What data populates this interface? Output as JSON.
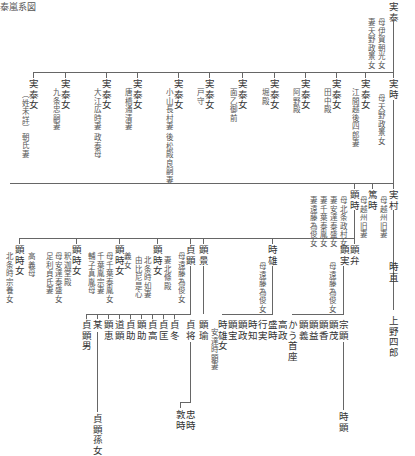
{
  "title": "泰嵐系図",
  "root": {
    "name": "実泰",
    "notes": [
      "母伊賀朝光女",
      "妻天野政景女"
    ]
  },
  "gen1": {
    "daughters": [
      {
        "name": "実泰女",
        "note": "江間越後四郎妻"
      },
      {
        "name": "実泰女",
        "note": "田中殿"
      },
      {
        "name": "実泰女",
        "note": "阿野殿"
      },
      {
        "name": "実泰女",
        "note": "堀殿"
      },
      {
        "name": "実泰女",
        "note": "面乙御前"
      },
      {
        "name": "実泰女",
        "note": "戸守"
      },
      {
        "name": "実泰女",
        "note": "小山長村妻 後松殿良嗣妻"
      },
      {
        "name": "実泰女",
        "note": "唐橋通清妻"
      },
      {
        "name": "実泰女",
        "note": "大江広時妻 政泰母"
      },
      {
        "name": "実泰女",
        "note": "九条忠嗣妻"
      },
      {
        "name": "実泰女",
        "note": "（姓未詳）朝氏妻"
      }
    ],
    "son": {
      "name": "実時",
      "note": "母天野政景女"
    }
  },
  "gen2": {
    "sanemura": {
      "name": "実村",
      "note": "母越州旧妻"
    },
    "atsutoki": {
      "name": "篤時",
      "note": "母越州旧妻"
    },
    "akitoki": {
      "name": "顕時",
      "notes": [
        "母北条政村女",
        "妻安達泰盛女",
        "妻千葉泰胤女",
        "妻遠藤為俊女"
      ]
    }
  },
  "gen3": {
    "daughters": [
      {
        "name": "顕時女",
        "notes": [
          "北条時宗養女"
        ],
        "extra": "高義母"
      },
      {
        "name": "顕時女",
        "notes": [
          "足利貞氏妻",
          "母安達泰盛女",
          "釈迦堂殿"
        ]
      },
      {
        "name": "顕時女",
        "notes": [
          "母千葉泰胤女",
          "千葉胤宗妻",
          "輔子真胤母"
        ],
        "extra": "義女"
      },
      {
        "name": "顕時女",
        "notes": [
          "北条時如妻",
          "由比尼是心"
        ]
      },
      {
        "name": "顕時女",
        "notes": [
          "妻北條殿",
          "女"
        ]
      }
    ],
    "sadaaki": {
      "name": "貞顕",
      "note": "母遠藤為俊女"
    },
    "akikage": {
      "name": "顕景"
    },
    "tokio": {
      "name": "時雄",
      "note": "母遠藤為俊女"
    },
    "akizane": {
      "name": "顕実",
      "note": "母遠藤為俊女"
    },
    "akiben": {
      "name": "顕弁"
    },
    "tokinao": {
      "name": "時直"
    }
  },
  "gen4": {
    "sadaaki_children": [
      "貞顕男",
      "某",
      "顕恵",
      "道顕",
      "貞助",
      "顕助",
      "貞高",
      "貞匡",
      "貞冬"
    ],
    "sadamasa": {
      "name": "貞将"
    },
    "akinori": {
      "name": "顕瑜",
      "note": "安達時顕妻"
    },
    "tokio_children": [
      "時雄女",
      "顕宝",
      "顕政",
      "時知",
      "行実",
      "盛時",
      "高政",
      "かう首座"
    ],
    "akizane_children": [
      "顕義",
      "顕益",
      "顕香",
      "顕茂",
      "宗顕"
    ],
    "uenoshiro": "上野四郎"
  },
  "gen5": {
    "granddaughter": "貞顕孫女",
    "tadatoki": "忠時",
    "atsutoki2": "敦時",
    "tokiaki": "時顕"
  }
}
